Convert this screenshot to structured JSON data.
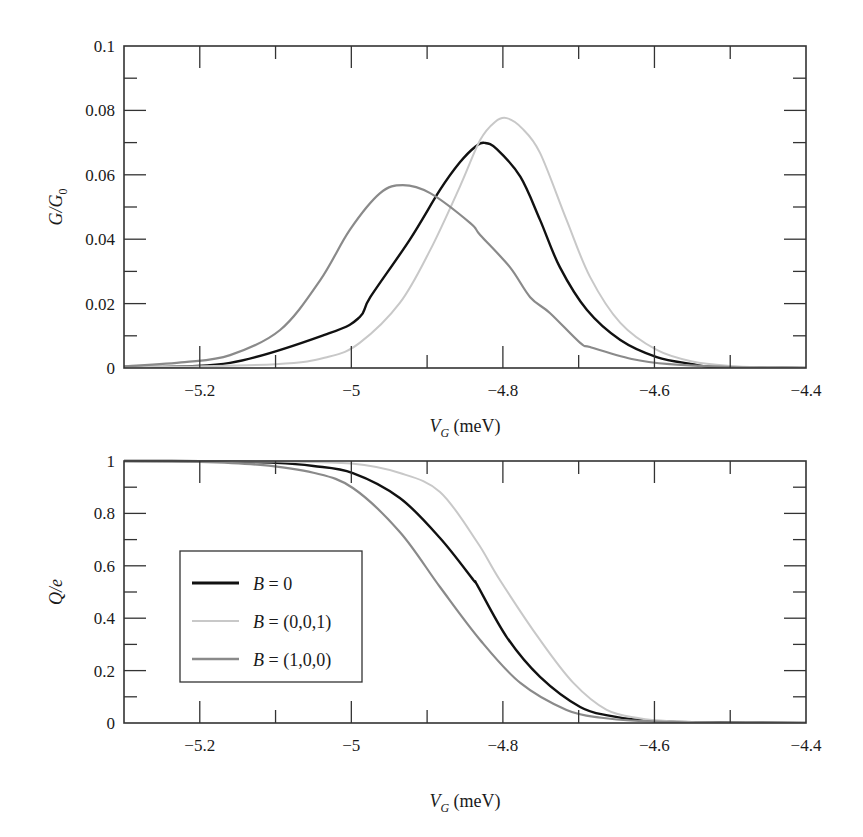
{
  "chart_data": [
    {
      "type": "line",
      "id": "top",
      "title": "",
      "xlabel": "V_G (meV)",
      "xlabel_main": "V",
      "xlabel_sub": "G",
      "xlabel_unit": " (meV)",
      "ylabel": "G/G_0",
      "ylabel_main": "G/G",
      "ylabel_sub": "0",
      "xlim": [
        -5.3,
        -4.4
      ],
      "ylim": [
        0,
        0.1
      ],
      "grid": false,
      "x_ticks": [
        -5.2,
        -5.0,
        -4.8,
        -4.6,
        -4.4
      ],
      "x_tick_labels": [
        "−5.2",
        "−5",
        "−4.8",
        "−4.6",
        "−4.4"
      ],
      "x_minor_ticks": [
        -5.1,
        -4.9,
        -4.7,
        -4.5
      ],
      "y_ticks": [
        0,
        0.02,
        0.04,
        0.06,
        0.08,
        0.1
      ],
      "y_tick_labels": [
        "0",
        "0.02",
        "0.04",
        "0.06",
        "0.08",
        "0.1"
      ],
      "y_minor_ticks": [
        0.01,
        0.03,
        0.05,
        0.07,
        0.09
      ],
      "series": [
        {
          "name": "B = 0",
          "color": "#111111",
          "width": 2.4,
          "x": [
            -5.3,
            -5.16,
            -5.028,
            -4.989,
            -4.975,
            -4.923,
            -4.883,
            -4.857,
            -4.836,
            -4.824,
            -4.808,
            -4.777,
            -4.751,
            -4.725,
            -4.689,
            -4.645,
            -4.597,
            -4.55,
            -4.523,
            -4.45,
            -4.4
          ],
          "y": [
            0.0003,
            0.0016,
            0.0109,
            0.0158,
            0.022,
            0.0398,
            0.0553,
            0.0638,
            0.0688,
            0.0699,
            0.068,
            0.0594,
            0.046,
            0.0314,
            0.018,
            0.0087,
            0.0034,
            0.0012,
            0.0003,
            0.0001,
            0.0
          ]
        },
        {
          "name": "B = (0,0,1)",
          "color": "#c8c8c8",
          "width": 2.0,
          "x": [
            -5.3,
            -5.1,
            -5.03,
            -4.989,
            -4.936,
            -4.896,
            -4.857,
            -4.83,
            -4.81,
            -4.795,
            -4.775,
            -4.751,
            -4.716,
            -4.685,
            -4.645,
            -4.597,
            -4.55,
            -4.5,
            -4.45,
            -4.4
          ],
          "y": [
            0.0002,
            0.0012,
            0.0035,
            0.0078,
            0.0202,
            0.0366,
            0.0562,
            0.0708,
            0.0765,
            0.0776,
            0.0745,
            0.0668,
            0.046,
            0.0283,
            0.014,
            0.0056,
            0.002,
            0.0006,
            0.0002,
            0.0
          ]
        },
        {
          "name": "B = (1,0,0)",
          "color": "#8a8a8a",
          "width": 2.2,
          "x": [
            -5.3,
            -5.22,
            -5.16,
            -5.094,
            -5.041,
            -5.002,
            -4.962,
            -4.932,
            -4.896,
            -4.843,
            -4.83,
            -4.791,
            -4.764,
            -4.738,
            -4.698,
            -4.685,
            -4.63,
            -4.58,
            -4.5,
            -4.4
          ],
          "y": [
            0.0005,
            0.0018,
            0.004,
            0.0118,
            0.0273,
            0.0429,
            0.0543,
            0.0568,
            0.0543,
            0.045,
            0.0413,
            0.0314,
            0.022,
            0.0171,
            0.0078,
            0.0065,
            0.0028,
            0.0012,
            0.0003,
            0.0
          ]
        }
      ]
    },
    {
      "type": "line",
      "id": "bottom",
      "title": "",
      "xlabel": "V_G (meV)",
      "xlabel_main": "V",
      "xlabel_sub": "G",
      "xlabel_unit": " (meV)",
      "ylabel": "Q/e",
      "xlim": [
        -5.3,
        -4.4
      ],
      "ylim": [
        0,
        1
      ],
      "grid": false,
      "legend_position": "center-left",
      "x_ticks": [
        -5.2,
        -5.0,
        -4.8,
        -4.6,
        -4.4
      ],
      "x_tick_labels": [
        "−5.2",
        "−5",
        "−4.8",
        "−4.6",
        "−4.4"
      ],
      "x_minor_ticks": [
        -5.1,
        -4.9,
        -4.7,
        -4.5
      ],
      "y_ticks": [
        0,
        0.2,
        0.4,
        0.6,
        0.8,
        1
      ],
      "y_tick_labels": [
        "0",
        "0.2",
        "0.4",
        "0.6",
        "0.8",
        "1"
      ],
      "y_minor_ticks": [
        0.1,
        0.3,
        0.5,
        0.7,
        0.9
      ],
      "legend": [
        {
          "label": "B = 0",
          "label_main": "B",
          "label_rest": " = 0",
          "color": "#111111",
          "width": 2.8
        },
        {
          "label": "B = (0,0,1)",
          "label_main": "B",
          "label_rest": " = (0,0,1)",
          "color": "#c8c8c8",
          "width": 2.2
        },
        {
          "label": "B = (1,0,0)",
          "label_main": "B",
          "label_rest": " = (1,0,0)",
          "color": "#8a8a8a",
          "width": 2.4
        }
      ],
      "series": [
        {
          "name": "B = 0",
          "color": "#111111",
          "width": 2.4,
          "x": [
            -5.3,
            -5.2,
            -5.1,
            -5.05,
            -4.998,
            -4.936,
            -4.883,
            -4.839,
            -4.834,
            -4.795,
            -4.751,
            -4.698,
            -4.66,
            -4.619,
            -4.55,
            -4.4
          ],
          "y": [
            1.0,
            0.999,
            0.993,
            0.981,
            0.954,
            0.859,
            0.706,
            0.546,
            0.527,
            0.328,
            0.176,
            0.061,
            0.028,
            0.011,
            0.003,
            0.0
          ]
        },
        {
          "name": "B = (0,0,1)",
          "color": "#c8c8c8",
          "width": 2.0,
          "x": [
            -5.3,
            -5.1,
            -5.0,
            -4.936,
            -4.883,
            -4.834,
            -4.804,
            -4.751,
            -4.707,
            -4.663,
            -4.62,
            -4.58,
            -4.5,
            -4.4
          ],
          "y": [
            1.0,
            0.998,
            0.99,
            0.954,
            0.882,
            0.691,
            0.546,
            0.317,
            0.153,
            0.05,
            0.018,
            0.007,
            0.001,
            0.0
          ]
        },
        {
          "name": "B = (1,0,0)",
          "color": "#8a8a8a",
          "width": 2.2,
          "x": [
            -5.3,
            -5.2,
            -5.12,
            -5.05,
            -4.998,
            -4.936,
            -4.883,
            -4.83,
            -4.777,
            -4.716,
            -4.67,
            -4.62,
            -4.55,
            -4.4
          ],
          "y": [
            1.0,
            0.997,
            0.985,
            0.955,
            0.897,
            0.729,
            0.519,
            0.317,
            0.153,
            0.05,
            0.02,
            0.008,
            0.002,
            0.0
          ]
        }
      ]
    }
  ],
  "layout": {
    "top": {
      "left": 124,
      "right": 806,
      "top": 46,
      "bottom": 368
    },
    "bottom": {
      "left": 124,
      "right": 806,
      "top": 461,
      "bottom": 723
    },
    "legend_box": {
      "x": 180,
      "y": 551,
      "w": 182,
      "h": 131
    }
  }
}
